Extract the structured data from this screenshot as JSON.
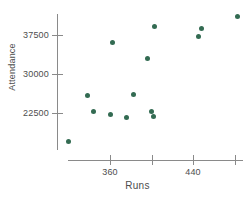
{
  "chart_data": {
    "type": "scatter",
    "title": "",
    "xlabel": "Runs",
    "ylabel": "Attendance",
    "xlim": [
      310,
      492
    ],
    "ylim": [
      15000,
      42000
    ],
    "grid": false,
    "legend": "none",
    "marker_color": "#336b52",
    "axis_color": "#8a8a8a",
    "xticks": [
      {
        "value": 360,
        "label": "360"
      },
      {
        "value": 400,
        "label": ""
      },
      {
        "value": 440,
        "label": "440"
      },
      {
        "value": 480,
        "label": ""
      }
    ],
    "yticks": [
      {
        "value": 37500,
        "label": "37500"
      },
      {
        "value": 30000,
        "label": "30000"
      },
      {
        "value": 22500,
        "label": "22500"
      }
    ],
    "points": [
      {
        "x": 320,
        "y": 17000
      },
      {
        "x": 338,
        "y": 25900
      },
      {
        "x": 344,
        "y": 22700
      },
      {
        "x": 360,
        "y": 22300
      },
      {
        "x": 362,
        "y": 36000
      },
      {
        "x": 376,
        "y": 21700
      },
      {
        "x": 383,
        "y": 26000
      },
      {
        "x": 396,
        "y": 32900
      },
      {
        "x": 400,
        "y": 22700
      },
      {
        "x": 402,
        "y": 21900
      },
      {
        "x": 403,
        "y": 39200
      },
      {
        "x": 445,
        "y": 37300
      },
      {
        "x": 448,
        "y": 38700
      },
      {
        "x": 483,
        "y": 41000
      }
    ]
  }
}
